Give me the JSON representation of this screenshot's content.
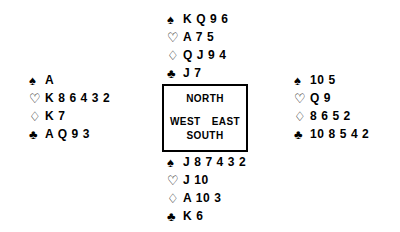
{
  "diagram": {
    "type": "bridge-deal",
    "suit_symbols": {
      "spades": "♠",
      "hearts": "♡",
      "diamonds": "♢",
      "clubs": "♣"
    },
    "compass": {
      "north": "NORTH",
      "west": "WEST",
      "east": "EAST",
      "south": "SOUTH"
    },
    "hands": {
      "north": {
        "spades": "K Q 9 6",
        "hearts": "A 7 5",
        "diamonds": "Q J 9 4",
        "clubs": "J 7"
      },
      "west": {
        "spades": "A",
        "hearts": "K 8 6 4 3 2",
        "diamonds": "K 7",
        "clubs": "A Q 9 3"
      },
      "east": {
        "spades": "10 5",
        "hearts": "Q 9",
        "diamonds": "8 6 5 2",
        "clubs": "10 8 5 4 2"
      },
      "south": {
        "spades": "J 8 7 4 3 2",
        "hearts": "J 10",
        "diamonds": "A 10 3",
        "clubs": "K 6"
      }
    }
  }
}
